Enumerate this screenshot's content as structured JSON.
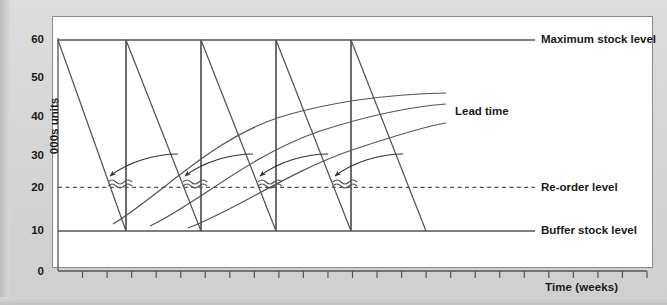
{
  "figure": {
    "kind": "stock-control-sawtooth-diagram",
    "background_color": "#d7d7d7",
    "panel_color": "#ffffff",
    "line_color": "#555555"
  },
  "axes": {
    "y": {
      "label": "000s units",
      "ticks": [
        "0",
        "10",
        "20",
        "30",
        "40",
        "50",
        "60"
      ],
      "min": 0,
      "max": 60
    },
    "x": {
      "label": "Time (weeks)",
      "tick_count": 24,
      "tick_labels": []
    }
  },
  "annotations": {
    "maximum_stock_level": "Maximum stock level",
    "re_order_level": "Re-order level",
    "buffer_stock_level": "Buffer stock level",
    "lead_time": "Lead time"
  },
  "chart_data": {
    "type": "line",
    "title": "",
    "xlabel": "Time (weeks)",
    "ylabel": "000s units",
    "ylim": [
      0,
      60
    ],
    "xlim": [
      0,
      24
    ],
    "grid": false,
    "legend": "right-side inline labels",
    "reference_lines": [
      {
        "name": "Maximum stock level",
        "value": 60,
        "style": "solid"
      },
      {
        "name": "Re-order level",
        "value": 20,
        "style": "dashed"
      },
      {
        "name": "Buffer stock level",
        "value": 10,
        "style": "solid"
      }
    ],
    "series": [
      {
        "name": "Stock level",
        "style": "sawtooth",
        "points": [
          {
            "x": 0.0,
            "y": 60
          },
          {
            "x": 3.0,
            "y": 10
          },
          {
            "x": 3.0,
            "y": 60
          },
          {
            "x": 6.0,
            "y": 10
          },
          {
            "x": 6.0,
            "y": 60
          },
          {
            "x": 9.0,
            "y": 10
          },
          {
            "x": 9.0,
            "y": 60
          },
          {
            "x": 12.0,
            "y": 10
          },
          {
            "x": 12.0,
            "y": 60
          },
          {
            "x": 15.0,
            "y": 10
          },
          {
            "x": 15.0,
            "y": 60
          }
        ]
      },
      {
        "name": "Lead time curve 1",
        "style": "curve",
        "points": [
          {
            "x": 2.2,
            "y": 13
          },
          {
            "x": 6.0,
            "y": 31
          },
          {
            "x": 10.0,
            "y": 39
          },
          {
            "x": 15.0,
            "y": 43
          },
          {
            "x": 18.5,
            "y": 44
          }
        ]
      },
      {
        "name": "Lead time curve 2",
        "style": "curve",
        "points": [
          {
            "x": 3.4,
            "y": 12
          },
          {
            "x": 7.2,
            "y": 29
          },
          {
            "x": 11.2,
            "y": 37
          },
          {
            "x": 16.0,
            "y": 40
          },
          {
            "x": 18.5,
            "y": 41
          }
        ]
      },
      {
        "name": "Lead time curve 3",
        "style": "curve",
        "points": [
          {
            "x": 4.6,
            "y": 11
          },
          {
            "x": 8.4,
            "y": 26
          },
          {
            "x": 12.4,
            "y": 33
          },
          {
            "x": 16.6,
            "y": 36
          },
          {
            "x": 18.5,
            "y": 37
          }
        ]
      }
    ],
    "arrows": [
      {
        "name": "re-order arrow 1",
        "to_x": 2.6,
        "to_y": 23
      },
      {
        "name": "re-order arrow 2",
        "to_x": 5.6,
        "to_y": 23
      },
      {
        "name": "re-order arrow 3",
        "to_x": 8.6,
        "to_y": 23
      },
      {
        "name": "re-order arrow 4",
        "to_x": 11.6,
        "to_y": 23
      }
    ],
    "squiggles": [
      {
        "name": "delivery squiggle 1",
        "x": 2.9
      },
      {
        "name": "delivery squiggle 2",
        "x": 5.9
      },
      {
        "name": "delivery squiggle 3",
        "x": 8.9
      },
      {
        "name": "delivery squiggle 4",
        "x": 11.9
      }
    ]
  }
}
